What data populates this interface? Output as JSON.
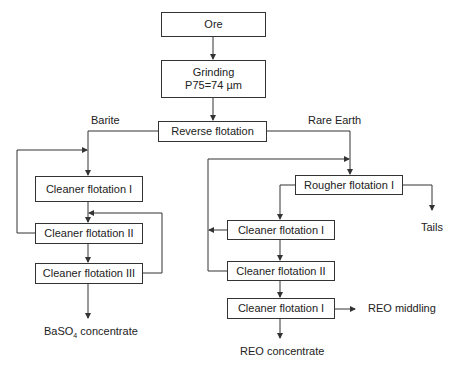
{
  "nodes": {
    "ore": "Ore",
    "grinding_line1": "Grinding",
    "grinding_line2": "P75=74 µm",
    "reverse_flotation": "Reverse flotation",
    "barite_cleaner_1": "Cleaner flotation I",
    "barite_cleaner_2": "Cleaner flotation II",
    "barite_cleaner_3": "Cleaner flotation III",
    "rougher_flotation": "Rougher flotation I",
    "re_cleaner_1": "Cleaner flotation I",
    "re_cleaner_2": "Cleaner flotation II",
    "re_cleaner_3": "Cleaner flotation I"
  },
  "labels": {
    "barite": "Barite",
    "rare_earth": "Rare Earth",
    "tails": "Tails",
    "baso4_prefix": "BaSO",
    "baso4_sub": "4",
    "baso4_suffix": " concentrate",
    "reo_middling": "REO middling",
    "reo_concentrate": "REO concentrate"
  },
  "colors": {
    "line": "#333333",
    "text": "#222222"
  }
}
